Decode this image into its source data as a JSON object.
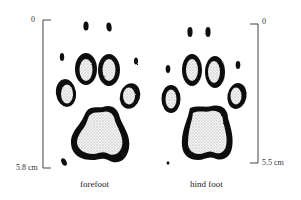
{
  "figure": {
    "forefoot": {
      "caption": "forefoot",
      "scale_top": "0",
      "scale_bottom": "5.8 cm"
    },
    "hind_foot": {
      "caption": "hind foot",
      "scale_top": "0",
      "scale_bottom": "5.5 cm"
    }
  }
}
